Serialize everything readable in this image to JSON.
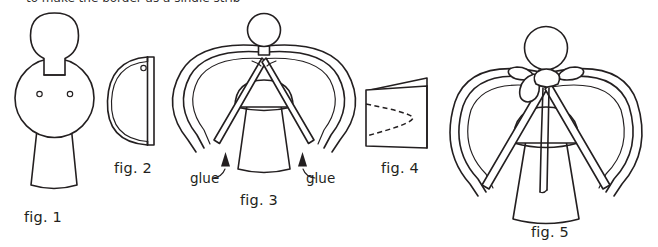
{
  "page": {
    "kind": "craft-instruction-diagram",
    "background_color": "#ffffff",
    "ink_color": "#231f20",
    "top_clipped_text": "to make the border as a single strip"
  },
  "figures": [
    {
      "id": "fig1",
      "label": "fig. 1",
      "caption_position": "below",
      "description": "flat cut-out body template: round head on a neck tab, large circular torso with two small punched holes, flared skirt"
    },
    {
      "id": "fig2",
      "label": "fig. 2",
      "caption_position": "below",
      "description": "side view of the rolled body showing the half-round curve meeting the straight back edge with one punched hole"
    },
    {
      "id": "fig3",
      "label": "fig. 3",
      "caption_position": "below",
      "description": "assembled angel with double-loop paper wings, arrows pointing to the two glue points at the lower wing tips"
    },
    {
      "id": "fig4",
      "label": "fig. 4",
      "caption_position": "below",
      "description": "folded card with a dashed cutting line forming a pointed leaf shape"
    },
    {
      "id": "fig5",
      "label": "fig. 5",
      "caption_position": "below",
      "description": "finished angel with wings attached and a ribbon bow tied at the neck with trailing ends"
    }
  ],
  "annotations": [
    {
      "id": "glue-left",
      "text": "glue",
      "target": "fig3 left wing tip"
    },
    {
      "id": "glue-right",
      "text": "glue",
      "target": "fig3 right wing tip"
    }
  ]
}
